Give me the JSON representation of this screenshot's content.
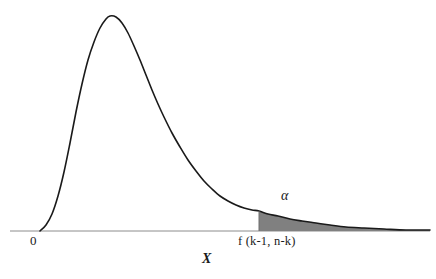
{
  "figure": {
    "name": "f-distribution-density-curve",
    "background_color": "#ffffff",
    "curve_color": "#1a1a1a",
    "axis_color": "#8c8c8c",
    "shade_color": "#808080",
    "text_color": "#1a1a1a"
  },
  "labels": {
    "origin": "0",
    "alpha": "α",
    "critical_value": "f (k-1, n-k)",
    "x_axis": "X"
  },
  "chart_data": {
    "type": "area",
    "title": "",
    "subtitle": "",
    "xlabel": "X",
    "ylabel": "",
    "grid": false,
    "legend": null,
    "axis": {
      "x_start_px": 10,
      "x_end_px": 430,
      "baseline_y_px": 231,
      "x_tick_labels": [
        "0",
        "f (k-1, n-k)"
      ],
      "x_tick_positions_px": [
        36,
        259
      ]
    },
    "annotations": [
      {
        "text": "α",
        "meaning": "significance-level-tail-area",
        "x_px": 288,
        "y_px": 198
      },
      {
        "text": "f (k-1, n-k)",
        "meaning": "critical-value-of-f-distribution",
        "x_px": 280,
        "y_px": 241
      },
      {
        "text": "0",
        "meaning": "origin",
        "x_px": 36,
        "y_px": 241
      },
      {
        "text": "X",
        "meaning": "random-variable-axis-label",
        "x_px": 208,
        "y_px": 259
      }
    ],
    "shaded_region": {
      "label": "α",
      "from_x_px": 259,
      "to_x_px": 430,
      "fill": "#808080",
      "description": "right-tail rejection region"
    },
    "curve_points_px": [
      [
        40,
        231
      ],
      [
        46,
        225
      ],
      [
        52,
        214
      ],
      [
        58,
        196
      ],
      [
        64,
        172
      ],
      [
        70,
        143
      ],
      [
        76,
        112
      ],
      [
        82,
        84
      ],
      [
        88,
        60
      ],
      [
        94,
        42
      ],
      [
        100,
        28
      ],
      [
        106,
        19
      ],
      [
        110,
        16
      ],
      [
        116,
        17
      ],
      [
        122,
        23
      ],
      [
        128,
        33
      ],
      [
        134,
        46
      ],
      [
        140,
        60
      ],
      [
        146,
        75
      ],
      [
        152,
        90
      ],
      [
        158,
        104
      ],
      [
        164,
        117
      ],
      [
        172,
        133
      ],
      [
        180,
        147
      ],
      [
        188,
        160
      ],
      [
        196,
        171
      ],
      [
        204,
        181
      ],
      [
        212,
        189
      ],
      [
        220,
        196
      ],
      [
        228,
        201
      ],
      [
        236,
        205
      ],
      [
        244,
        208
      ],
      [
        252,
        210
      ],
      [
        259,
        211
      ],
      [
        268,
        214
      ],
      [
        278,
        216
      ],
      [
        290,
        219
      ],
      [
        302,
        221
      ],
      [
        316,
        223
      ],
      [
        330,
        225
      ],
      [
        346,
        227
      ],
      [
        364,
        228
      ],
      [
        384,
        229
      ],
      [
        406,
        230
      ],
      [
        430,
        230
      ]
    ]
  }
}
